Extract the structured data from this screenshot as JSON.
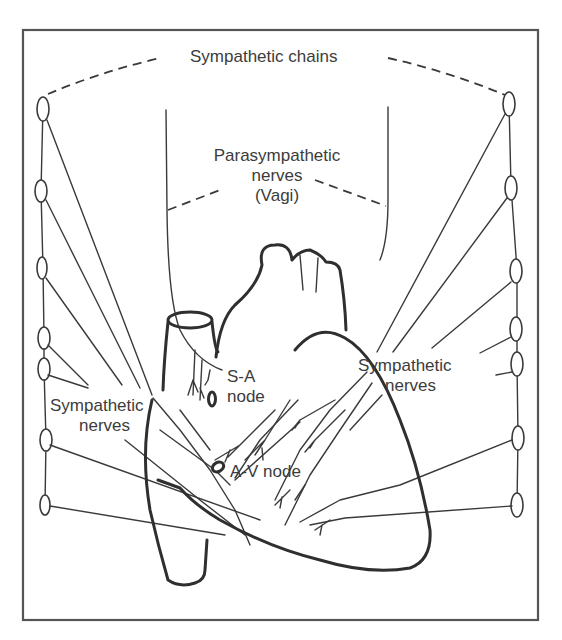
{
  "diagram": {
    "labels": {
      "sympathetic_chains": "Sympathetic chains",
      "parasympathetic_line1": "Parasympathetic",
      "parasympathetic_line2": "nerves",
      "parasympathetic_line3": "(Vagi)",
      "sa_line1": "S-A",
      "sa_line2": "node",
      "av_node": "A-V node",
      "symp_left_line1": "Sympathetic",
      "symp_left_line2": "nerves",
      "symp_right_line1": "Sympathetic",
      "symp_right_line2": "nerves"
    },
    "left_chain_ganglia_y": [
      106,
      191,
      268,
      337,
      368,
      440,
      505
    ],
    "right_chain_ganglia_y": [
      103,
      186,
      270,
      328,
      362,
      437,
      505
    ],
    "colors": {
      "line": "#3a3a3a",
      "frame": "#555555",
      "text": "#3c3c3c",
      "background": "#ffffff"
    }
  }
}
